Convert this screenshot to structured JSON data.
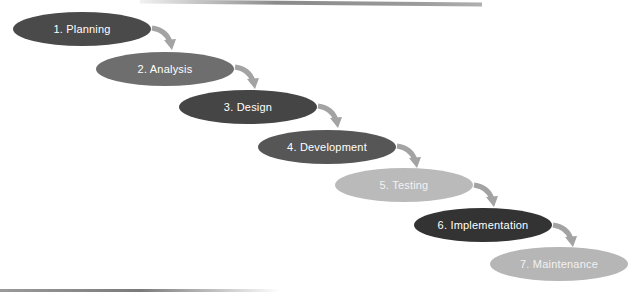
{
  "diagram": {
    "type": "waterfall-sdlc",
    "stages": [
      {
        "label": "1. Planning",
        "color": "#4a4a4a",
        "text_color": "#ffffff",
        "x": 13,
        "y": 12
      },
      {
        "label": "2. Analysis",
        "color": "#6e6e6e",
        "text_color": "#ffffff",
        "x": 96,
        "y": 52
      },
      {
        "label": "3. Design",
        "color": "#454545",
        "text_color": "#ffffff",
        "x": 179,
        "y": 90
      },
      {
        "label": "4. Development",
        "color": "#565656",
        "text_color": "#ffffff",
        "x": 258,
        "y": 130
      },
      {
        "label": "5. Testing",
        "color": "#bababa",
        "text_color": "#f2f2f2",
        "x": 335,
        "y": 168
      },
      {
        "label": "6. Implementation",
        "color": "#333333",
        "text_color": "#ffffff",
        "x": 414,
        "y": 208
      },
      {
        "label": "7. Maintenance",
        "color": "#b6b6b6",
        "text_color": "#f2f2f2",
        "x": 490,
        "y": 247
      }
    ],
    "arrow_color": "#a3a3a3"
  }
}
